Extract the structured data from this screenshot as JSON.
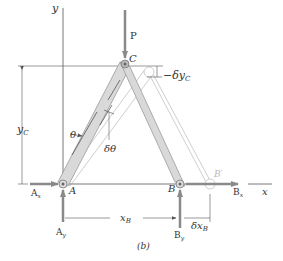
{
  "figure": {
    "caption": "(b)",
    "axes": {
      "x_label": "x",
      "y_label": "y"
    },
    "points": {
      "A": "A",
      "B": "B",
      "B_prime": "B′",
      "C": "C"
    },
    "forces": {
      "P": "P",
      "Ax": "A",
      "Ax_sub": "x",
      "Ay": "A",
      "Ay_sub": "y",
      "Bx": "B",
      "Bx_sub": "x",
      "By": "B",
      "By_sub": "y"
    },
    "dimensions": {
      "yC": "y",
      "yC_sub": "C",
      "xB": "x",
      "xB_sub": "B",
      "delta_yC": "−δy",
      "delta_yC_sub": "C",
      "delta_xB": "δx",
      "delta_xB_sub": "B"
    },
    "angles": {
      "theta": "θ",
      "delta_theta": "δθ"
    },
    "colors": {
      "bar_fill": "#d9d9d9",
      "bar_edge": "#9a9a9a",
      "ghost_edge": "#c8c8c8",
      "force_arrow": "#8a8a8a",
      "line": "#555555"
    }
  }
}
